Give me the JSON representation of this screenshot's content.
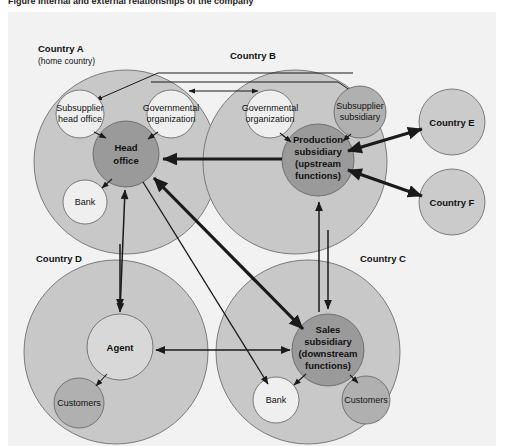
{
  "caption": "Figure   Internal and external relationships of the company",
  "panel": {
    "background": "#f2f2f2"
  },
  "colors": {
    "country_circle": "#c8c8c8",
    "country_circle_stroke": "#6f6f6f",
    "satellite_circle": "#cbcbcb",
    "entity_dark": "#9a9a9a",
    "entity_light": "#efefef",
    "entity_mid": "#b0b0b0",
    "arrow": "#1a1a1a",
    "text": "#111111"
  },
  "countries": [
    {
      "id": "A",
      "label": "Country A",
      "sublabel": "(home country)",
      "label_x": 30,
      "label_y": 40,
      "cx": 118,
      "cy": 150,
      "r": 92
    },
    {
      "id": "B",
      "label": "Country B",
      "sublabel": "",
      "label_x": 222,
      "label_y": 47,
      "cx": 287,
      "cy": 150,
      "r": 92
    },
    {
      "id": "C",
      "label": "Country C",
      "sublabel": "",
      "label_x": 352,
      "label_y": 250,
      "cx": 300,
      "cy": 340,
      "r": 92
    },
    {
      "id": "D",
      "label": "Country D",
      "sublabel": "",
      "label_x": 28,
      "label_y": 250,
      "cx": 108,
      "cy": 340,
      "r": 92
    }
  ],
  "satellites": [
    {
      "id": "E",
      "label": "Country E",
      "cx": 444,
      "cy": 110,
      "r": 33
    },
    {
      "id": "F",
      "label": "Country F",
      "cx": 444,
      "cy": 190,
      "r": 33
    }
  ],
  "entities": [
    {
      "id": "head-office",
      "lines": [
        "Head",
        "office"
      ],
      "bold": true,
      "cx": 118,
      "cy": 142,
      "r": 33,
      "fill": "entity_dark"
    },
    {
      "id": "subsupplier-head-office",
      "lines": [
        "Subsupplier",
        "head office"
      ],
      "bold": false,
      "cx": 72,
      "cy": 102,
      "r": 24,
      "fill": "entity_light"
    },
    {
      "id": "governmental-organization-a",
      "lines": [
        "Governmental",
        "organization"
      ],
      "bold": false,
      "cx": 163,
      "cy": 102,
      "r": 24,
      "fill": "entity_light"
    },
    {
      "id": "bank-a",
      "lines": [
        "Bank"
      ],
      "bold": false,
      "cx": 77,
      "cy": 190,
      "r": 22,
      "fill": "entity_light"
    },
    {
      "id": "production-subsidiary",
      "lines": [
        "Production",
        "subsidiary",
        "(upstream",
        "functions)"
      ],
      "bold": true,
      "cx": 310,
      "cy": 148,
      "r": 36,
      "fill": "entity_dark"
    },
    {
      "id": "governmental-organization-b",
      "lines": [
        "Governmental",
        "organization"
      ],
      "bold": false,
      "cx": 262,
      "cy": 102,
      "r": 24,
      "fill": "entity_light"
    },
    {
      "id": "subsupplier-subsidiary",
      "lines": [
        "Subsupplier",
        "subsidiary"
      ],
      "bold": false,
      "cx": 352,
      "cy": 100,
      "r": 26,
      "fill": "entity_mid"
    },
    {
      "id": "sales-subsidiary",
      "lines": [
        "Sales",
        "subsidiary",
        "(downstream",
        "functions)"
      ],
      "bold": true,
      "cx": 320,
      "cy": 338,
      "r": 36,
      "fill": "entity_dark"
    },
    {
      "id": "bank-c",
      "lines": [
        "Bank"
      ],
      "bold": false,
      "cx": 268,
      "cy": 388,
      "r": 23,
      "fill": "entity_light"
    },
    {
      "id": "customers-c",
      "lines": [
        "Customers"
      ],
      "bold": false,
      "cx": 358,
      "cy": 388,
      "r": 24,
      "fill": "entity_mid"
    },
    {
      "id": "agent",
      "lines": [
        "Agent"
      ],
      "bold": true,
      "cx": 112,
      "cy": 335,
      "r": 33,
      "fill": "entity_light"
    },
    {
      "id": "customers-d",
      "lines": [
        "Customers"
      ],
      "bold": false,
      "cx": 71,
      "cy": 391,
      "r": 25,
      "fill": "entity_mid"
    }
  ],
  "connections": [
    {
      "from": "external",
      "to": "subsupplier-head-office",
      "style": "thin-orthogonal"
    },
    {
      "from": "external",
      "to": "subsupplier-subsidiary",
      "style": "thin-orthogonal"
    },
    {
      "from": "governmental-organization-a",
      "to": "governmental-organization-b",
      "style": "thin-double"
    },
    {
      "from": "subsupplier-head-office",
      "to": "head-office",
      "style": "thin-arrow"
    },
    {
      "from": "governmental-organization-a",
      "to": "head-office",
      "style": "thin-arrow"
    },
    {
      "from": "head-office",
      "to": "bank-a",
      "style": "thin-arrow"
    },
    {
      "from": "production-subsidiary",
      "to": "head-office",
      "style": "thick-arrow"
    },
    {
      "from": "governmental-organization-b",
      "to": "production-subsidiary",
      "style": "thin-arrow"
    },
    {
      "from": "subsupplier-subsidiary",
      "to": "production-subsidiary",
      "style": "thin-arrow"
    },
    {
      "from": "production-subsidiary",
      "to": "satellite-E",
      "style": "thick-double"
    },
    {
      "from": "production-subsidiary",
      "to": "satellite-F",
      "style": "thick-double"
    },
    {
      "from": "head-office",
      "to": "agent",
      "style": "thin-double-vertical"
    },
    {
      "from": "head-office",
      "to": "sales-subsidiary",
      "style": "thick-double-diagonal"
    },
    {
      "from": "sales-subsidiary",
      "to": "production-subsidiary",
      "style": "thin-vertical"
    },
    {
      "from": "production-subsidiary",
      "to": "agent",
      "style": "thin-vertical"
    },
    {
      "from": "agent",
      "to": "sales-subsidiary",
      "style": "thin-double-horizontal"
    },
    {
      "from": "agent",
      "to": "customers-d",
      "style": "thin-arrow"
    },
    {
      "from": "sales-subsidiary",
      "to": "bank-c",
      "style": "thin-arrow"
    },
    {
      "from": "sales-subsidiary",
      "to": "customers-c",
      "style": "thin-arrow"
    },
    {
      "from": "head-office",
      "to": "bank-c",
      "style": "thin-arrow-long"
    }
  ]
}
